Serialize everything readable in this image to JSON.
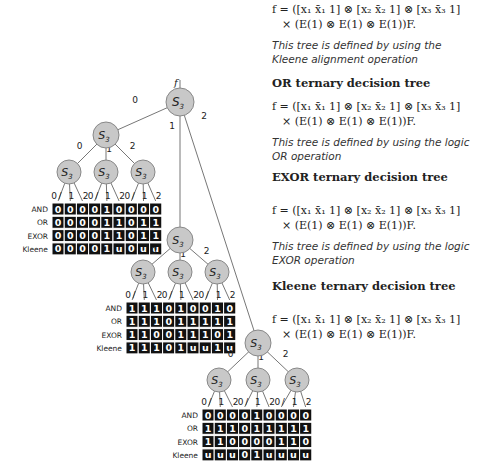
{
  "tree": {
    "root_label": "f",
    "node_label": "S3",
    "edge_labels": [
      "0",
      "1",
      "2"
    ],
    "row_labels": [
      "AND",
      "OR",
      "EXOR",
      "Kleene"
    ],
    "tables": [
      {
        "AND": [
          "0",
          "0",
          "0",
          "0",
          "1",
          "0",
          "0",
          "0",
          "0"
        ],
        "OR": [
          "0",
          "0",
          "0",
          "0",
          "1",
          "1",
          "0",
          "1",
          "1"
        ],
        "EXOR": [
          "0",
          "0",
          "0",
          "0",
          "1",
          "1",
          "0",
          "1",
          "1"
        ],
        "Kleene": [
          "0",
          "0",
          "0",
          "0",
          "1",
          "u",
          "0",
          "u",
          "u"
        ]
      },
      {
        "AND": [
          "1",
          "1",
          "1",
          "0",
          "1",
          "0",
          "0",
          "1",
          "0"
        ],
        "OR": [
          "1",
          "1",
          "1",
          "0",
          "1",
          "1",
          "1",
          "1",
          "1"
        ],
        "EXOR": [
          "1",
          "1",
          "0",
          "0",
          "1",
          "1",
          "1",
          "0",
          "1"
        ],
        "Kleene": [
          "1",
          "1",
          "1",
          "0",
          "1",
          "u",
          "u",
          "1",
          "u"
        ]
      },
      {
        "AND": [
          "0",
          "0",
          "0",
          "0",
          "1",
          "0",
          "0",
          "0",
          "0"
        ],
        "OR": [
          "1",
          "1",
          "1",
          "0",
          "1",
          "1",
          "1",
          "1",
          "1"
        ],
        "EXOR": [
          "1",
          "1",
          "0",
          "0",
          "0",
          "0",
          "1",
          "1",
          "0"
        ],
        "Kleene": [
          "u",
          "u",
          "u",
          "0",
          "1",
          "u",
          "u",
          "u",
          "u"
        ]
      }
    ]
  },
  "sections": [
    {
      "heading": "",
      "formula_line1": "f = ([x₁ x̄₁ 1] ⊗ [x₂ x̄₂ 1] ⊗ [x₃ x̄₃ 1]",
      "formula_line2": "× (E(1) ⊗ E(1) ⊗ E(1))F.",
      "note": "This tree is defined by using the Kleene alignment operation"
    },
    {
      "heading": "OR ternary decision tree",
      "formula_line1": "f = ([x₁ x̄₁ 1] ⊗ [x₂ x̄₂ 1] ⊗ [x₃ x̄₃ 1]",
      "formula_line2": "× (E(1) ⊗ E(1) ⊗ E(1))F.",
      "note": "This tree is defined by using the logic OR operation"
    },
    {
      "heading": "EXOR ternary decision tree",
      "formula_line1": "f = ([x₁ x̄₁ 1] ⊗ [x₂ x̄₂ 1] ⊗ [x₃ x̄₃ 1]",
      "formula_line2": "× (E(1) ⊗ E(1) ⊗ E(1))F.",
      "note": "This tree is defined by using the logic EXOR operation"
    },
    {
      "heading": "Kleene ternary decision tree",
      "formula_line1": "f = ([x₁ x̄₁ 1] ⊗ [x₂ x̄₂ 1] ⊗ [x₃ x̄₃ 1]",
      "formula_line2": "× (E(1) ⊗ E(1) ⊗ E(1))F.",
      "note": ""
    }
  ]
}
